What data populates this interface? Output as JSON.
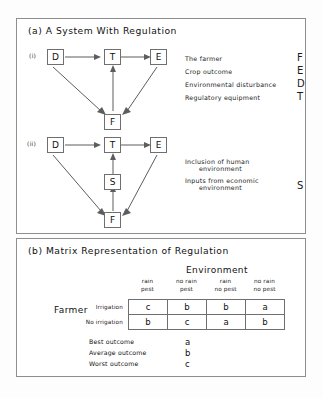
{
  "panel_a": {
    "title": "(a) A System With Regulation",
    "diagram_i": {
      "marker": "(i)",
      "nodes": [
        {
          "id": "D",
          "label": "D"
        },
        {
          "id": "T",
          "label": "T"
        },
        {
          "id": "E",
          "label": "E"
        },
        {
          "id": "F",
          "label": "F"
        }
      ],
      "edges": [
        {
          "from": "D",
          "to": "T"
        },
        {
          "from": "T",
          "to": "E"
        },
        {
          "from": "D",
          "to": "F"
        },
        {
          "from": "E",
          "to": "F"
        },
        {
          "from": "F",
          "to": "T"
        }
      ]
    },
    "diagram_ii": {
      "marker": "(ii)",
      "nodes": [
        {
          "id": "D",
          "label": "D"
        },
        {
          "id": "T",
          "label": "T"
        },
        {
          "id": "E",
          "label": "E"
        },
        {
          "id": "S",
          "label": "S"
        },
        {
          "id": "F",
          "label": "F"
        }
      ],
      "edges": [
        {
          "from": "D",
          "to": "T"
        },
        {
          "from": "T",
          "to": "E"
        },
        {
          "from": "D",
          "to": "F"
        },
        {
          "from": "E",
          "to": "F"
        },
        {
          "from": "F",
          "to": "S"
        },
        {
          "from": "S",
          "to": "T"
        }
      ]
    },
    "legend_i": [
      {
        "text": "The farmer",
        "symbol": "F"
      },
      {
        "text": "Crop outcome",
        "symbol": "E"
      },
      {
        "text": "Environmental disturbance",
        "symbol": "D"
      },
      {
        "text": "Regulatory equipment",
        "symbol": "T"
      }
    ],
    "legend_ii": [
      {
        "line1": "Inclusion of human",
        "line2": "environment",
        "symbol": ""
      },
      {
        "line1": "Inputs from economic",
        "line2": "environment",
        "symbol": "S"
      }
    ]
  },
  "panel_b": {
    "title": "(b) Matrix Representation of Regulation",
    "environment_heading": "Environment",
    "farmer_heading": "Farmer",
    "column_headers": [
      {
        "line1": "rain",
        "line2": "pest"
      },
      {
        "line1": "no rain",
        "line2": "pest"
      },
      {
        "line1": "rain",
        "line2": "no pest"
      },
      {
        "line1": "no rain",
        "line2": "no pest"
      }
    ],
    "row_headers": [
      "Irrigation",
      "No irrigation"
    ],
    "matrix": [
      [
        "c",
        "b",
        "b",
        "a"
      ],
      [
        "b",
        "c",
        "a",
        "b"
      ]
    ],
    "outcome_key": [
      {
        "label": "Best outcome",
        "symbol": "a"
      },
      {
        "label": "Average outcome",
        "symbol": "b"
      },
      {
        "label": "Worst outcome",
        "symbol": "c"
      }
    ]
  },
  "colors": {
    "ink": "#111111",
    "rule": "#6f6f6f",
    "panel_border": "#8e8e8e",
    "background": "#fdfdfd"
  }
}
